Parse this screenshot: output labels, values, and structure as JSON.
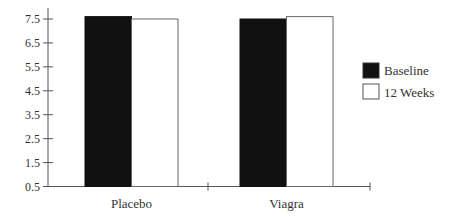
{
  "chart_data": {
    "type": "bar",
    "title": "",
    "xlabel": "",
    "ylabel": "",
    "categories": [
      "Placebo",
      "Viagra"
    ],
    "series": [
      {
        "name": "Baseline",
        "values": [
          7.6,
          7.5
        ],
        "color": "#111111"
      },
      {
        "name": "12 Weeks",
        "values": [
          7.5,
          7.6
        ],
        "color": "#ffffff"
      }
    ],
    "yticks": [
      "0.5",
      "1.5",
      "2.5",
      "3.5",
      "4.5",
      "5.5",
      "6.5",
      "7.5"
    ],
    "ylim": [
      0.5,
      7.5
    ],
    "grid": false,
    "legend_position": "right"
  },
  "legend": {
    "items": [
      {
        "label": "Baseline"
      },
      {
        "label": "12 Weeks"
      }
    ]
  }
}
